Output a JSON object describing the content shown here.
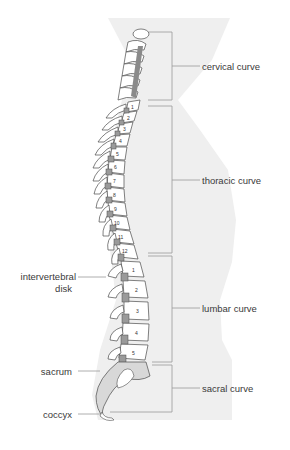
{
  "diagram": {
    "curves": [
      {
        "label": "cervical curve"
      },
      {
        "label": "thoracic curve"
      },
      {
        "label": "lumbar curve"
      },
      {
        "label": "sacral curve"
      }
    ],
    "left_labels": [
      {
        "label_line1": "intervertebral",
        "label_line2": "disk"
      },
      {
        "label": "sacrum"
      },
      {
        "label": "coccyx"
      }
    ],
    "thoracic_numbers": [
      "1",
      "2",
      "3",
      "4",
      "5",
      "6",
      "7",
      "8",
      "9",
      "10",
      "11",
      "12"
    ],
    "lumbar_numbers": [
      "1",
      "2",
      "3",
      "4",
      "5"
    ],
    "colors": {
      "body_silhouette": "#efefef",
      "bone_fill": "#ffffff",
      "bone_outline": "#4a4a4a",
      "disk_fill": "#9a9a9a",
      "sacrum_fill": "#d8d8d8",
      "bracket_line": "#9a9a9a",
      "text": "#3a3a3a"
    }
  }
}
